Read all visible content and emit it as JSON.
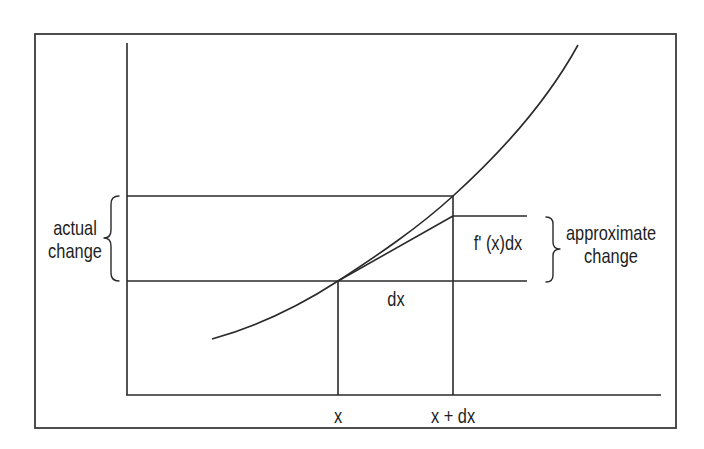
{
  "diagram": {
    "type": "differential-approximation",
    "labels": {
      "actual_change_line1": "actual",
      "actual_change_line2": "change",
      "approx_change_line1": "approximate",
      "approx_change_line2": "change",
      "derivative_term": "f' (x)dx",
      "dx_label": "dx",
      "x_tick": "x",
      "x_plus_dx_tick": "x + dx"
    },
    "colors": {
      "line": "#2a2a2a",
      "frame": "#3a3a3a",
      "text": "#1e1e1e",
      "background": "#ffffff"
    },
    "elements": {
      "curve": "increasing convex curve y = f(x)",
      "tangent_line": "tangent at x, extended to x + dx",
      "horizontal_guides": [
        "f(x)",
        "f(x) + f'(x)dx",
        "f(x + dx)"
      ],
      "vertical_guides": [
        "x",
        "x + dx"
      ],
      "braces": [
        "actual change (left)",
        "approximate change (right)"
      ]
    }
  }
}
